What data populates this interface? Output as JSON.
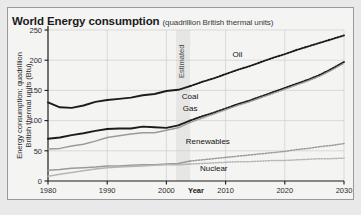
{
  "figure": {
    "title": "World Energy consumption",
    "subtitle": "(quadrillion British thermal units)"
  },
  "colors": {
    "panel_background": "#f4f4f3",
    "outer_background": "#e9e9e9",
    "frame": "#9a9a9a",
    "gridline": "#cfcfcf",
    "axis": "#1a1a1a",
    "dark_series": "#1c1c1c",
    "mid_series": "#9a9a9a",
    "light_series": "#b5b5b5",
    "estimated_band": "#e6e6e4"
  },
  "chart_data": {
    "type": "line",
    "title": "World Energy consumption",
    "subtitle": "(quadrillion British thermal units)",
    "xlabel": "Year",
    "ylabel": "Energy consumption; quadrillion British thermal units (Btu)",
    "xlim": [
      1980,
      2030
    ],
    "ylim": [
      0,
      250
    ],
    "xticks": [
      1980,
      1990,
      2000,
      2010,
      2020,
      2030
    ],
    "xticklabels": [
      "1980",
      "1990",
      "2000",
      "2010",
      "2020",
      "2030"
    ],
    "yticks": [
      0,
      50,
      100,
      150,
      200,
      250
    ],
    "yticklabels": [
      "0",
      "50",
      "100",
      "150",
      "200",
      "250"
    ],
    "grid": true,
    "legend": "inline-labels",
    "annotations": [
      {
        "text": "Estimated",
        "x": 2004,
        "rotation": -90
      }
    ],
    "history_end": 2004,
    "projection_start": 2004,
    "x": [
      1980,
      1982,
      1984,
      1986,
      1988,
      1990,
      1992,
      1994,
      1996,
      1998,
      2000,
      2002,
      2004,
      2006,
      2008,
      2010,
      2012,
      2014,
      2016,
      2018,
      2020,
      2022,
      2024,
      2026,
      2028,
      2030
    ],
    "series": [
      {
        "name": "Oil",
        "style": "dark-thick",
        "label_x": 2012,
        "label_y": 205,
        "values": [
          130,
          122,
          121,
          125,
          131,
          134,
          136,
          138,
          142,
          144,
          149,
          151,
          157,
          164,
          170,
          177,
          184,
          190,
          197,
          204,
          210,
          217,
          223,
          229,
          235,
          241
        ]
      },
      {
        "name": "Coal",
        "style": "dark-thick",
        "label_x": 2004,
        "label_y": 136,
        "values": [
          70,
          72,
          76,
          79,
          83,
          86,
          87,
          87,
          90,
          89,
          88,
          92,
          100,
          107,
          113,
          120,
          127,
          133,
          140,
          147,
          154,
          161,
          168,
          176,
          186,
          197
        ]
      },
      {
        "name": "Gas",
        "style": "mid",
        "label_x": 2004,
        "label_y": 116,
        "values": [
          53,
          54,
          58,
          61,
          66,
          72,
          75,
          78,
          80,
          80,
          84,
          88,
          97,
          104,
          111,
          118,
          125,
          131,
          138,
          145,
          152,
          159,
          166,
          174,
          184,
          195
        ]
      },
      {
        "name": "Renewables",
        "style": "mid",
        "label_x": 2007,
        "label_y": 62,
        "values": [
          18,
          19,
          21,
          22,
          23,
          25,
          25,
          26,
          27,
          27,
          28,
          29,
          33,
          35,
          37,
          39,
          41,
          43,
          45,
          47,
          49,
          52,
          54,
          57,
          59,
          62
        ]
      },
      {
        "name": "Nuclear",
        "style": "light",
        "label_x": 2008,
        "label_y": 17,
        "values": [
          8,
          11,
          14,
          17,
          20,
          22,
          23,
          24,
          25,
          26,
          27,
          27,
          28,
          29,
          30,
          31,
          32,
          32,
          33,
          34,
          34,
          35,
          36,
          37,
          37,
          38
        ]
      }
    ]
  }
}
